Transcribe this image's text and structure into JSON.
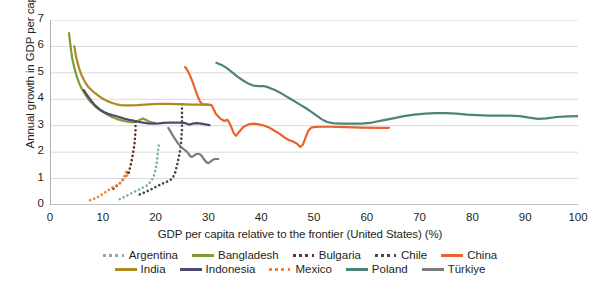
{
  "chart_data": {
    "type": "line",
    "title": "",
    "xlabel": "GDP per capita relative to the frontier (United States) (%)",
    "ylabel": "Annual growth in GDP per capita (%)",
    "xlim": [
      0,
      100
    ],
    "ylim": [
      0,
      7
    ],
    "xticks": [
      0,
      10,
      20,
      30,
      40,
      50,
      60,
      70,
      80,
      90,
      100
    ],
    "yticks": [
      0,
      1,
      2,
      3,
      4,
      5,
      6,
      7
    ],
    "grid": "horizontal",
    "legend_position": "bottom",
    "series": [
      {
        "name": "Argentina",
        "color": "#7fb3a8",
        "style": "dotted",
        "points": [
          [
            13.2,
            0.22
          ],
          [
            14.0,
            0.3
          ],
          [
            14.8,
            0.38
          ],
          [
            15.6,
            0.46
          ],
          [
            16.3,
            0.53
          ],
          [
            17.0,
            0.6
          ],
          [
            17.6,
            0.66
          ],
          [
            18.2,
            0.72
          ],
          [
            18.7,
            0.8
          ],
          [
            19.1,
            0.9
          ],
          [
            19.5,
            1.02
          ],
          [
            19.8,
            1.18
          ],
          [
            20.0,
            1.36
          ],
          [
            20.2,
            1.55
          ],
          [
            20.3,
            1.75
          ],
          [
            20.4,
            1.95
          ],
          [
            20.5,
            2.12
          ],
          [
            20.6,
            2.25
          ]
        ]
      },
      {
        "name": "Bangladesh",
        "color": "#7f9c32",
        "style": "solid",
        "points": [
          [
            3.6,
            6.5
          ],
          [
            3.9,
            6.0
          ],
          [
            4.2,
            5.55
          ],
          [
            4.6,
            5.2
          ],
          [
            5.0,
            4.9
          ],
          [
            5.5,
            4.62
          ],
          [
            6.0,
            4.4
          ],
          [
            6.6,
            4.2
          ],
          [
            7.2,
            4.02
          ],
          [
            7.9,
            3.86
          ],
          [
            8.6,
            3.72
          ],
          [
            9.4,
            3.6
          ],
          [
            10.2,
            3.5
          ],
          [
            11.0,
            3.4
          ],
          [
            11.8,
            3.32
          ],
          [
            12.6,
            3.26
          ],
          [
            13.4,
            3.21
          ],
          [
            14.2,
            3.17
          ],
          [
            15.0,
            3.14
          ],
          [
            15.8,
            3.13
          ],
          [
            16.4,
            3.16
          ],
          [
            17.0,
            3.22
          ],
          [
            17.6,
            3.27
          ],
          [
            18.2,
            3.22
          ],
          [
            18.8,
            3.15
          ],
          [
            19.4,
            3.12
          ],
          [
            20.0,
            3.1
          ]
        ]
      },
      {
        "name": "Bulgaria",
        "color": "#6b3326",
        "style": "dotted",
        "points": [
          [
            12.0,
            0.62
          ],
          [
            12.5,
            0.7
          ],
          [
            13.0,
            0.78
          ],
          [
            13.4,
            0.86
          ],
          [
            13.8,
            0.95
          ],
          [
            14.1,
            1.05
          ],
          [
            14.4,
            1.18
          ],
          [
            14.7,
            1.28
          ],
          [
            14.9,
            1.2
          ],
          [
            15.0,
            1.3
          ],
          [
            15.2,
            1.45
          ],
          [
            15.4,
            1.62
          ],
          [
            15.6,
            1.82
          ],
          [
            15.8,
            2.05
          ],
          [
            16.0,
            2.3
          ],
          [
            16.1,
            2.55
          ],
          [
            16.2,
            2.8
          ],
          [
            16.2,
            3.05
          ],
          [
            16.2,
            3.22
          ]
        ]
      },
      {
        "name": "Chile",
        "color": "#3f4a54",
        "style": "dotted",
        "points": [
          [
            17.0,
            0.4
          ],
          [
            18.0,
            0.48
          ],
          [
            19.0,
            0.58
          ],
          [
            20.0,
            0.68
          ],
          [
            21.0,
            0.78
          ],
          [
            21.8,
            0.86
          ],
          [
            22.4,
            0.9
          ],
          [
            22.9,
            0.96
          ],
          [
            23.3,
            1.05
          ],
          [
            23.7,
            1.22
          ],
          [
            24.0,
            1.45
          ],
          [
            24.3,
            1.72
          ],
          [
            24.6,
            2.0
          ],
          [
            24.8,
            2.3
          ],
          [
            24.9,
            2.6
          ],
          [
            25.0,
            2.85
          ],
          [
            25.0,
            3.1
          ],
          [
            25.0,
            3.35
          ],
          [
            25.0,
            3.6
          ],
          [
            25.0,
            3.85
          ]
        ]
      },
      {
        "name": "China",
        "color": "#e8622a",
        "style": "solid",
        "points": [
          [
            25.6,
            5.22
          ],
          [
            26.0,
            5.1
          ],
          [
            26.4,
            4.95
          ],
          [
            26.8,
            4.76
          ],
          [
            27.2,
            4.55
          ],
          [
            27.6,
            4.32
          ],
          [
            28.0,
            4.1
          ],
          [
            28.4,
            3.92
          ],
          [
            28.8,
            3.82
          ],
          [
            29.2,
            3.8
          ],
          [
            29.8,
            3.8
          ],
          [
            30.6,
            3.78
          ],
          [
            31.4,
            3.45
          ],
          [
            32.2,
            3.28
          ],
          [
            33.0,
            3.18
          ],
          [
            33.6,
            3.22
          ],
          [
            34.0,
            3.1
          ],
          [
            34.4,
            2.92
          ],
          [
            34.8,
            2.72
          ],
          [
            35.2,
            2.62
          ],
          [
            35.8,
            2.76
          ],
          [
            36.6,
            2.95
          ],
          [
            37.6,
            3.05
          ],
          [
            38.6,
            3.08
          ],
          [
            39.6,
            3.05
          ],
          [
            40.6,
            3.0
          ],
          [
            41.6,
            2.92
          ],
          [
            42.6,
            2.8
          ],
          [
            43.6,
            2.68
          ],
          [
            44.4,
            2.56
          ],
          [
            45.2,
            2.46
          ],
          [
            46.0,
            2.4
          ],
          [
            46.8,
            2.32
          ],
          [
            47.4,
            2.2
          ],
          [
            47.9,
            2.28
          ],
          [
            48.4,
            2.55
          ],
          [
            48.9,
            2.8
          ],
          [
            49.4,
            2.92
          ],
          [
            50.0,
            2.95
          ],
          [
            51.0,
            2.96
          ],
          [
            53.0,
            2.96
          ],
          [
            56.0,
            2.95
          ],
          [
            59.0,
            2.93
          ],
          [
            62.0,
            2.92
          ],
          [
            64.2,
            2.92
          ]
        ]
      },
      {
        "name": "India",
        "color": "#b0881f",
        "style": "solid",
        "points": [
          [
            4.6,
            6.0
          ],
          [
            5.0,
            5.55
          ],
          [
            5.5,
            5.18
          ],
          [
            6.0,
            4.9
          ],
          [
            6.6,
            4.66
          ],
          [
            7.2,
            4.48
          ],
          [
            7.9,
            4.34
          ],
          [
            8.6,
            4.22
          ],
          [
            9.4,
            4.1
          ],
          [
            10.2,
            4.0
          ],
          [
            11.0,
            3.92
          ],
          [
            11.8,
            3.86
          ],
          [
            12.6,
            3.81
          ],
          [
            13.4,
            3.78
          ],
          [
            14.2,
            3.77
          ],
          [
            15.2,
            3.77
          ],
          [
            16.5,
            3.78
          ],
          [
            18.0,
            3.8
          ],
          [
            19.5,
            3.82
          ],
          [
            21.0,
            3.83
          ],
          [
            22.5,
            3.83
          ],
          [
            24.0,
            3.82
          ],
          [
            25.5,
            3.81
          ],
          [
            27.0,
            3.8
          ],
          [
            28.5,
            3.8
          ],
          [
            30.0,
            3.8
          ]
        ]
      },
      {
        "name": "Indonesia",
        "color": "#4d4a72",
        "style": "solid",
        "points": [
          [
            6.4,
            4.35
          ],
          [
            6.8,
            4.22
          ],
          [
            7.3,
            4.08
          ],
          [
            7.9,
            3.92
          ],
          [
            8.6,
            3.76
          ],
          [
            9.4,
            3.62
          ],
          [
            10.2,
            3.52
          ],
          [
            11.0,
            3.45
          ],
          [
            11.8,
            3.4
          ],
          [
            12.6,
            3.36
          ],
          [
            13.4,
            3.31
          ],
          [
            14.2,
            3.26
          ],
          [
            15.0,
            3.22
          ],
          [
            15.8,
            3.19
          ],
          [
            16.6,
            3.15
          ],
          [
            17.6,
            3.12
          ],
          [
            18.6,
            3.09
          ],
          [
            19.6,
            3.08
          ],
          [
            20.6,
            3.09
          ],
          [
            21.6,
            3.11
          ],
          [
            22.6,
            3.12
          ],
          [
            23.6,
            3.12
          ],
          [
            24.6,
            3.12
          ],
          [
            25.6,
            3.1
          ],
          [
            26.4,
            3.04
          ],
          [
            27.0,
            3.08
          ],
          [
            27.8,
            3.1
          ],
          [
            28.6,
            3.08
          ],
          [
            29.4,
            3.05
          ],
          [
            30.2,
            3.02
          ]
        ]
      },
      {
        "name": "Mexico",
        "color": "#f0823c",
        "style": "dotted",
        "points": [
          [
            7.6,
            0.18
          ],
          [
            8.2,
            0.22
          ],
          [
            8.8,
            0.28
          ],
          [
            9.4,
            0.34
          ],
          [
            10.0,
            0.42
          ],
          [
            10.6,
            0.5
          ],
          [
            11.2,
            0.58
          ],
          [
            11.8,
            0.66
          ],
          [
            12.4,
            0.72
          ],
          [
            12.9,
            0.78
          ],
          [
            13.3,
            0.84
          ],
          [
            13.6,
            0.9
          ],
          [
            13.9,
            0.98
          ],
          [
            14.1,
            1.08
          ],
          [
            14.3,
            1.18
          ],
          [
            14.4,
            1.26
          ],
          [
            14.5,
            1.2
          ],
          [
            14.6,
            1.12
          ],
          [
            14.7,
            1.05
          ],
          [
            14.8,
            1.0
          ]
        ]
      },
      {
        "name": "Poland",
        "color": "#4b8479",
        "style": "solid",
        "points": [
          [
            31.5,
            5.38
          ],
          [
            32.5,
            5.3
          ],
          [
            33.5,
            5.18
          ],
          [
            34.5,
            5.02
          ],
          [
            35.5,
            4.86
          ],
          [
            36.5,
            4.72
          ],
          [
            37.5,
            4.6
          ],
          [
            38.5,
            4.52
          ],
          [
            39.5,
            4.5
          ],
          [
            40.5,
            4.5
          ],
          [
            41.5,
            4.44
          ],
          [
            42.5,
            4.36
          ],
          [
            43.5,
            4.26
          ],
          [
            44.5,
            4.14
          ],
          [
            45.5,
            4.02
          ],
          [
            46.5,
            3.9
          ],
          [
            47.5,
            3.78
          ],
          [
            48.5,
            3.66
          ],
          [
            49.5,
            3.52
          ],
          [
            50.5,
            3.38
          ],
          [
            51.5,
            3.24
          ],
          [
            52.5,
            3.14
          ],
          [
            53.5,
            3.1
          ],
          [
            55.0,
            3.08
          ],
          [
            57.0,
            3.08
          ],
          [
            59.0,
            3.08
          ],
          [
            61.0,
            3.12
          ],
          [
            63.0,
            3.2
          ],
          [
            65.0,
            3.28
          ],
          [
            67.0,
            3.36
          ],
          [
            69.0,
            3.42
          ],
          [
            71.0,
            3.46
          ],
          [
            73.0,
            3.48
          ],
          [
            75.0,
            3.48
          ],
          [
            77.0,
            3.46
          ],
          [
            79.0,
            3.42
          ],
          [
            81.0,
            3.4
          ],
          [
            83.0,
            3.38
          ],
          [
            85.0,
            3.38
          ],
          [
            87.0,
            3.38
          ],
          [
            89.0,
            3.36
          ],
          [
            91.0,
            3.3
          ],
          [
            92.5,
            3.26
          ],
          [
            94.0,
            3.28
          ],
          [
            96.0,
            3.33
          ],
          [
            98.0,
            3.35
          ],
          [
            100.0,
            3.36
          ]
        ]
      },
      {
        "name": "Türkiye",
        "color": "#7b7b7b",
        "style": "solid",
        "points": [
          [
            22.4,
            2.92
          ],
          [
            23.0,
            2.72
          ],
          [
            23.6,
            2.52
          ],
          [
            24.2,
            2.34
          ],
          [
            24.8,
            2.2
          ],
          [
            25.4,
            2.1
          ],
          [
            25.9,
            2.02
          ],
          [
            26.3,
            1.92
          ],
          [
            26.6,
            1.84
          ],
          [
            26.9,
            1.82
          ],
          [
            27.2,
            1.86
          ],
          [
            27.6,
            1.92
          ],
          [
            28.0,
            1.94
          ],
          [
            28.4,
            1.92
          ],
          [
            28.8,
            1.84
          ],
          [
            29.2,
            1.72
          ],
          [
            29.6,
            1.62
          ],
          [
            30.0,
            1.58
          ],
          [
            30.4,
            1.64
          ],
          [
            30.9,
            1.72
          ],
          [
            31.4,
            1.74
          ],
          [
            31.9,
            1.74
          ]
        ]
      }
    ]
  },
  "legend": {
    "row1": [
      {
        "label": "Argentina",
        "color": "#7fb3a8",
        "style": "dotted",
        "icon": "dotted-line-swatch"
      },
      {
        "label": "Bangladesh",
        "color": "#7f9c32",
        "style": "solid",
        "icon": "solid-line-swatch"
      },
      {
        "label": "Bulgaria",
        "color": "#6b3326",
        "style": "dotted",
        "icon": "dotted-line-swatch"
      },
      {
        "label": "Chile",
        "color": "#3f4a54",
        "style": "dotted",
        "icon": "dotted-line-swatch"
      },
      {
        "label": "China",
        "color": "#e8622a",
        "style": "solid",
        "icon": "solid-line-swatch"
      }
    ],
    "row2": [
      {
        "label": "India",
        "color": "#b0881f",
        "style": "solid",
        "icon": "solid-line-swatch"
      },
      {
        "label": "Indonesia",
        "color": "#4d4a72",
        "style": "solid",
        "icon": "solid-line-swatch"
      },
      {
        "label": "Mexico",
        "color": "#f0823c",
        "style": "dotted",
        "icon": "dotted-line-swatch"
      },
      {
        "label": "Poland",
        "color": "#4b8479",
        "style": "solid",
        "icon": "solid-line-swatch"
      },
      {
        "label": "Türkiye",
        "color": "#7b7b7b",
        "style": "solid",
        "icon": "solid-line-swatch"
      }
    ]
  },
  "axis_style": {
    "grid_color": "#d9d9d9",
    "axis_color": "#808080",
    "text_color": "#231f20"
  }
}
